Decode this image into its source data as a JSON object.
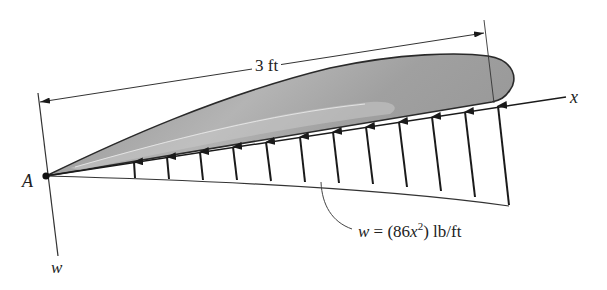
{
  "figure": {
    "dimension": {
      "label": "3 ft"
    },
    "point_label": "A",
    "axis_x_label": "x",
    "axis_w_label": "w",
    "load": {
      "var": "w",
      "eq": " = (86",
      "x": "x",
      "exp": "2",
      "unit": ") lb/ft"
    },
    "arrow_count": 12,
    "colors": {
      "ink": "#1a1a1a",
      "airfoil_fill": "#a9a9a9",
      "airfoil_highlight": "#d4d4d4"
    }
  }
}
